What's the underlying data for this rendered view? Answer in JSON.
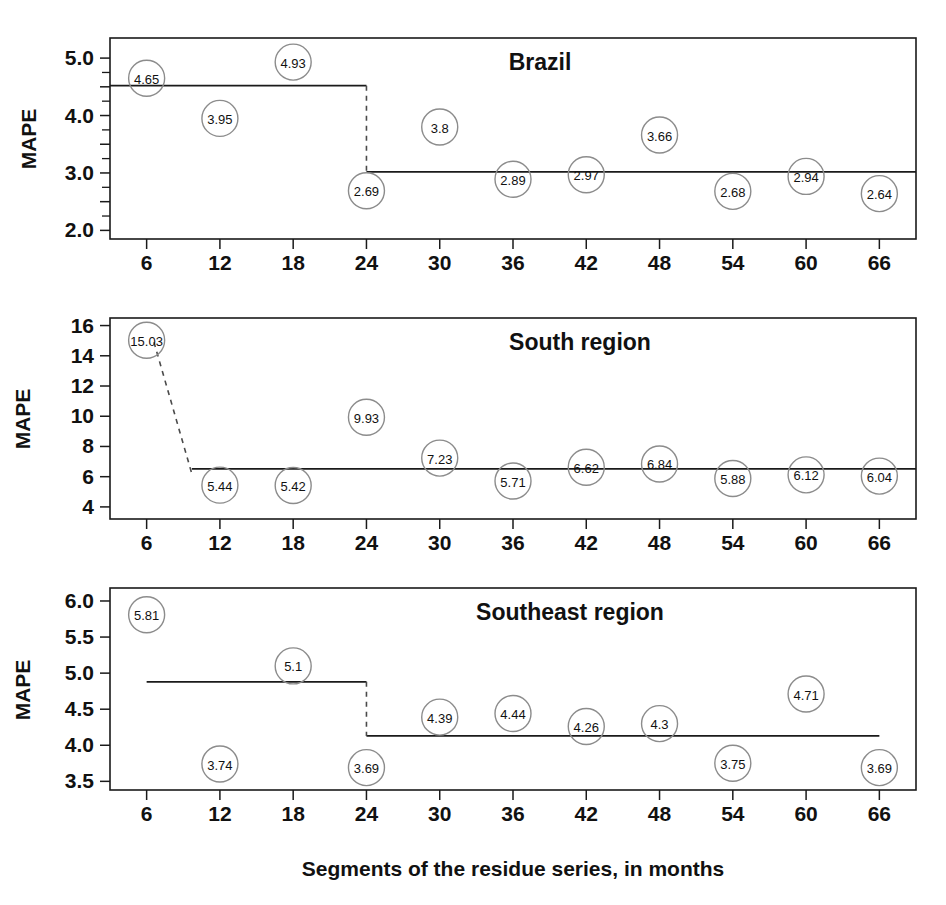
{
  "figure": {
    "title": "",
    "xlabel": "Segments of the residue series, in months",
    "ylabel": "MAPE",
    "background": "#ffffff",
    "line_color": "#1a1a1a",
    "marker_stroke": "#8c8c8c",
    "text_color": "#111111"
  },
  "chart_data": [
    {
      "type": "scatter",
      "title": "Brazil",
      "xlabel": "Segments of the residue series, in months",
      "ylabel": "MAPE",
      "x": [
        6,
        12,
        18,
        24,
        30,
        36,
        42,
        48,
        54,
        60,
        66
      ],
      "xtick_labels": [
        "6",
        "12",
        "18",
        "24",
        "30",
        "36",
        "42",
        "48",
        "54",
        "60",
        "66"
      ],
      "values": [
        4.65,
        3.95,
        4.93,
        2.69,
        3.8,
        2.89,
        2.97,
        3.66,
        2.68,
        2.94,
        2.64
      ],
      "point_labels": [
        "4.65",
        "3.95",
        "4.93",
        "2.69",
        "3.8",
        "2.89",
        "2.97",
        "3.66",
        "2.68",
        "2.94",
        "2.64"
      ],
      "ylim": [
        1.85,
        5.35
      ],
      "ytick_values": [
        2.0,
        2.5,
        3.0,
        3.5,
        4.0,
        4.5,
        5.0
      ],
      "ytick_labels": [
        "2.0",
        "",
        "3.0",
        "",
        "4.0",
        "",
        "5.0"
      ],
      "xlim": [
        3,
        69
      ],
      "grid": false,
      "legend": "none",
      "segments": [
        {
          "x_start": 3,
          "x_end": 24,
          "level": 4.52
        },
        {
          "x_start": 24,
          "x_end": 69,
          "level": 3.02
        }
      ],
      "breaks": [
        {
          "x": 24,
          "from": 4.52,
          "to": 3.02,
          "style": "dashed"
        }
      ]
    },
    {
      "type": "scatter",
      "title": "South region",
      "xlabel": "Segments of the residue series, in months",
      "ylabel": "MAPE",
      "x": [
        6,
        12,
        18,
        24,
        30,
        36,
        42,
        48,
        54,
        60,
        66
      ],
      "xtick_labels": [
        "6",
        "12",
        "18",
        "24",
        "30",
        "36",
        "42",
        "48",
        "54",
        "60",
        "66"
      ],
      "values": [
        15.03,
        5.44,
        5.42,
        9.93,
        7.23,
        5.71,
        6.62,
        6.84,
        5.88,
        6.12,
        6.04
      ],
      "point_labels": [
        "15.03",
        "5.44",
        "5.42",
        "9.93",
        "7.23",
        "5.71",
        "6.62",
        "6.84",
        "5.88",
        "6.12",
        "6.04"
      ],
      "ylim": [
        3.2,
        16.5
      ],
      "ytick_values": [
        4,
        6,
        8,
        10,
        12,
        14,
        16
      ],
      "ytick_labels": [
        "4",
        "6",
        "8",
        "10",
        "12",
        "14",
        "16"
      ],
      "xlim": [
        3,
        69
      ],
      "grid": false,
      "legend": "none",
      "segments": [
        {
          "x_start": 9.7,
          "x_end": 69,
          "level": 6.52
        }
      ],
      "breaks": [
        {
          "x": 6.6,
          "x_end": 9.7,
          "from": 14.9,
          "to": 6.2,
          "style": "dashed-slanted"
        }
      ]
    },
    {
      "type": "scatter",
      "title": "Southeast region",
      "xlabel": "Segments of the residue series, in months",
      "ylabel": "MAPE",
      "x": [
        6,
        12,
        18,
        24,
        30,
        36,
        42,
        48,
        54,
        60,
        66
      ],
      "xtick_labels": [
        "6",
        "12",
        "18",
        "24",
        "30",
        "36",
        "42",
        "48",
        "54",
        "60",
        "66"
      ],
      "values": [
        5.81,
        3.74,
        5.1,
        3.69,
        4.39,
        4.44,
        4.26,
        4.3,
        3.75,
        4.71,
        3.69
      ],
      "point_labels": [
        "5.81",
        "3.74",
        "5.1",
        "3.69",
        "4.39",
        "4.44",
        "4.26",
        "4.3",
        "3.75",
        "4.71",
        "3.69"
      ],
      "ylim": [
        3.38,
        6.18
      ],
      "ytick_values": [
        3.5,
        4.0,
        4.5,
        5.0,
        5.5,
        6.0
      ],
      "ytick_labels": [
        "3.5",
        "4.0",
        "4.5",
        "5.0",
        "5.5",
        "6.0"
      ],
      "xlim": [
        3,
        69
      ],
      "grid": false,
      "legend": "none",
      "segments": [
        {
          "x_start": 6,
          "x_end": 24,
          "level": 4.88
        },
        {
          "x_start": 24,
          "x_end": 66,
          "level": 4.13
        }
      ],
      "breaks": [
        {
          "x": 24,
          "from": 4.88,
          "to": 4.13,
          "style": "dashed"
        }
      ]
    }
  ]
}
